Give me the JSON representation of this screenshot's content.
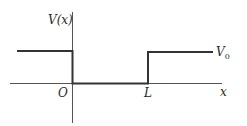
{
  "diagram": {
    "type": "potential-well",
    "y_axis_label": "V(x)",
    "x_axis_label": "x",
    "origin_label": "O",
    "well_edge_label": "L",
    "barrier_label": "V",
    "barrier_label_subscript": "0",
    "colors": {
      "line": "#333333",
      "text": "#2a2a2a",
      "background": "#ffffff"
    }
  }
}
